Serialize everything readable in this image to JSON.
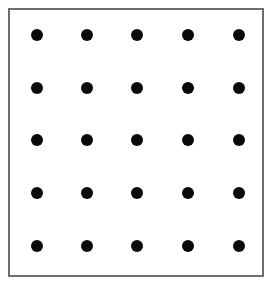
{
  "diagram": {
    "type": "dot-grid",
    "rows": 5,
    "columns": 5,
    "dot_color": "#0a0a0a",
    "border_color": "#6e6e6e",
    "background_color": "#ffffff",
    "dot_x": [
      37,
      87,
      137,
      188,
      239
    ],
    "dot_y": [
      35,
      88,
      140,
      193,
      246
    ],
    "dot_radius": 6
  }
}
